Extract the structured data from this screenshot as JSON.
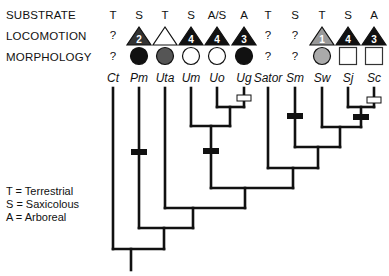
{
  "rows": {
    "substrate_label": "SUBSTRATE",
    "locomotion_label": "LOCOMOTION",
    "morphology_label": "MORPHOLOGY"
  },
  "taxa": [
    {
      "name": "Ct",
      "x": 113,
      "substrate": "T",
      "locomotion": {
        "type": "unknown",
        "text": "?"
      },
      "morphology": {
        "type": "unknown",
        "text": "?"
      }
    },
    {
      "name": "Pm",
      "x": 139,
      "substrate": "S",
      "locomotion": {
        "type": "triangle",
        "fill": "#333333",
        "num": "2"
      },
      "morphology": {
        "type": "circle",
        "fill": "#111111"
      }
    },
    {
      "name": "Uta",
      "x": 165,
      "substrate": "T",
      "locomotion": {
        "type": "triangle",
        "fill": "#ffffff",
        "num": ""
      },
      "morphology": {
        "type": "circle",
        "fill": "#555555"
      }
    },
    {
      "name": "Um",
      "x": 191,
      "substrate": "S",
      "locomotion": {
        "type": "triangle",
        "fill": "#111111",
        "num": "4"
      },
      "morphology": {
        "type": "circle",
        "fill": "#ffffff"
      }
    },
    {
      "name": "Uo",
      "x": 217,
      "substrate": "A/S",
      "locomotion": {
        "type": "triangle",
        "fill": "#111111",
        "num": "4"
      },
      "morphology": {
        "type": "circle",
        "fill": "#ffffff"
      }
    },
    {
      "name": "Ug",
      "x": 244,
      "substrate": "A",
      "locomotion": {
        "type": "triangle",
        "fill": "#111111",
        "num": "3"
      },
      "morphology": {
        "type": "circle",
        "fill": "#111111"
      }
    },
    {
      "name": "Sator",
      "x": 268,
      "substrate": "T",
      "locomotion": {
        "type": "unknown",
        "text": "?"
      },
      "morphology": {
        "type": "unknown",
        "text": "?"
      }
    },
    {
      "name": "Sm",
      "x": 295,
      "substrate": "S",
      "locomotion": {
        "type": "unknown",
        "text": "?"
      },
      "morphology": {
        "type": "unknown",
        "text": "?"
      }
    },
    {
      "name": "Sw",
      "x": 322,
      "substrate": "T",
      "locomotion": {
        "type": "triangle",
        "fill": "#999999",
        "num": "1"
      },
      "morphology": {
        "type": "circle",
        "fill": "#aaaaaa"
      }
    },
    {
      "name": "Sj",
      "x": 348,
      "substrate": "S",
      "locomotion": {
        "type": "triangle",
        "fill": "#111111",
        "num": "4"
      },
      "morphology": {
        "type": "square",
        "fill": "#ffffff"
      }
    },
    {
      "name": "Sc",
      "x": 374,
      "substrate": "A",
      "locomotion": {
        "type": "triangle",
        "fill": "#111111",
        "num": "3"
      },
      "morphology": {
        "type": "square",
        "fill": "#ffffff"
      }
    }
  ],
  "legend": {
    "t": "T = Terrestrial",
    "s": "S = Saxicolous",
    "a": "A = Arboreal"
  },
  "tree": {
    "tip_top": 88,
    "nodes": [
      {
        "id": "UoUg",
        "left": 217,
        "right": 244,
        "y": 107,
        "x": 230
      },
      {
        "id": "Um_UoUg",
        "left": 191,
        "right": 230,
        "y": 126,
        "x": 211
      },
      {
        "id": "SjSc",
        "left": 348,
        "right": 374,
        "y": 107,
        "x": 361
      },
      {
        "id": "Sw_SjSc",
        "left": 322,
        "right": 361,
        "y": 127,
        "x": 340
      },
      {
        "id": "Sm_clade",
        "left": 295,
        "right": 340,
        "y": 147,
        "x": 318
      },
      {
        "id": "Sator_clade",
        "left": 268,
        "right": 318,
        "y": 168,
        "x": 293
      },
      {
        "id": "Uro_Scel",
        "left": 211,
        "right": 293,
        "y": 188,
        "x": 245
      },
      {
        "id": "Uta_clade",
        "left": 165,
        "right": 245,
        "y": 208,
        "x": 193
      },
      {
        "id": "Pm_clade",
        "left": 139,
        "right": 193,
        "y": 228,
        "x": 164
      },
      {
        "id": "root",
        "left": 113,
        "right": 164,
        "y": 249,
        "x": 131
      }
    ],
    "root_bottom": 270,
    "black_bars": [
      {
        "x": 139,
        "y": 152
      },
      {
        "x": 211,
        "y": 151
      },
      {
        "x": 295,
        "y": 116
      },
      {
        "x": 361,
        "y": 117
      }
    ],
    "open_bars": [
      {
        "x": 244,
        "y": 98
      },
      {
        "x": 374,
        "y": 100
      }
    ]
  }
}
